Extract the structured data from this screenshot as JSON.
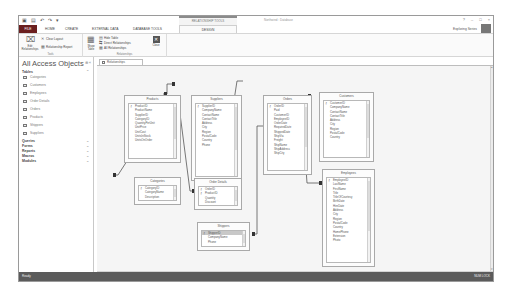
{
  "titlebar": {
    "quick_access": [
      "save-icon",
      "undo-icon",
      "redo-icon",
      "customize-icon"
    ],
    "contextual_group": "RELATIONSHIP TOOLS",
    "window_title": "Northwind : Database",
    "controls": [
      "?",
      "–",
      "□",
      "×"
    ]
  },
  "tabs": {
    "items": [
      "FILE",
      "HOME",
      "CREATE",
      "EXTERNAL DATA",
      "DATABASE TOOLS",
      "DESIGN"
    ],
    "active": "DESIGN",
    "account": "Exploring Series"
  },
  "ribbon": {
    "tools": {
      "label": "Tools",
      "edit_relationships": "Edit Relationships",
      "clear_layout": "Clear Layout",
      "relationship_report": "Relationship Report"
    },
    "relationships": {
      "label": "Relationships",
      "show_table": "Show Table",
      "hide_table": "Hide Table",
      "direct_relationships": "Direct Relationships",
      "all_relationships": "All Relationships",
      "close": "Close"
    }
  },
  "nav": {
    "title": "All Access Objects",
    "groups": {
      "tables": "Tables",
      "queries": "Queries",
      "forms": "Forms",
      "reports": "Reports",
      "macros": "Macros",
      "modules": "Modules"
    },
    "tables": [
      "Categories",
      "Customers",
      "Employees",
      "Order Details",
      "Orders",
      "Products",
      "Shippers",
      "Suppliers"
    ]
  },
  "document_tab": "Relationships",
  "diagram": {
    "tables": {
      "products": {
        "title": "Products",
        "fields": [
          "ProductID",
          "ProductName",
          "SupplierID",
          "CategoryID",
          "QuantityPerUnit",
          "UnitPrice",
          "UnitCost",
          "UnitsInStock",
          "UnitsOnOrder"
        ],
        "keys": [
          0
        ]
      },
      "suppliers": {
        "title": "Suppliers",
        "fields": [
          "SupplierID",
          "CompanyName",
          "ContactName",
          "ContactTitle",
          "Address",
          "City",
          "Region",
          "PostalCode",
          "Country",
          "Phone"
        ],
        "keys": [
          0
        ]
      },
      "orders": {
        "title": "Orders",
        "fields": [
          "OrderID",
          "Paid",
          "CustomerID",
          "EmployeeID",
          "OrderDate",
          "RequiredDate",
          "ShippedDate",
          "ShipVia",
          "Freight",
          "ShipName",
          "ShipAddress",
          "ShipCity"
        ],
        "keys": [
          0
        ]
      },
      "customers": {
        "title": "Customers",
        "fields": [
          "CustomerID",
          "CompanyName",
          "ContactName",
          "ContactTitle",
          "Address",
          "City",
          "Region",
          "PostalCode",
          "Country"
        ],
        "keys": [
          0
        ]
      },
      "categories": {
        "title": "Categories",
        "fields": [
          "CategoryID",
          "CategoryName",
          "Description"
        ],
        "keys": [
          0
        ]
      },
      "order_details": {
        "title": "Order Details",
        "fields": [
          "OrderID",
          "ProductID",
          "Quantity",
          "Discount"
        ],
        "keys": [
          0,
          1
        ]
      },
      "shippers": {
        "title": "Shippers",
        "fields": [
          "ShipperID",
          "CompanyName",
          "Phone"
        ],
        "keys": [
          0
        ],
        "selected": 0
      },
      "employees": {
        "title": "Employees",
        "fields": [
          "EmployeeID",
          "LastName",
          "FirstName",
          "Title",
          "TitleOfCourtesy",
          "BirthDate",
          "HireDate",
          "Address",
          "City",
          "Region",
          "PostalCode",
          "Country",
          "HomePhone",
          "Extension",
          "Photo"
        ],
        "keys": [
          0
        ]
      }
    }
  },
  "status": {
    "left": "Ready",
    "right": "NUM LOCK"
  }
}
